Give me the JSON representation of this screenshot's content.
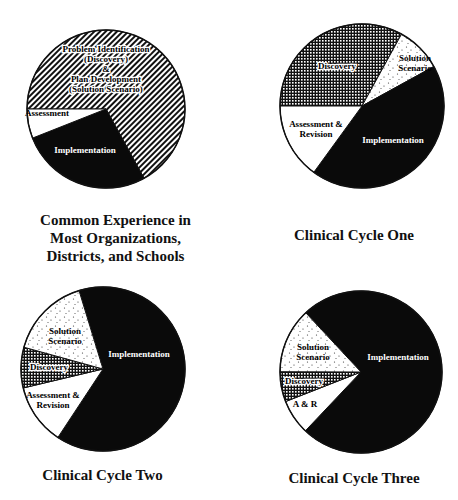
{
  "chart_data": [
    {
      "type": "pie",
      "title": "Common Experience in Most Organizations, Districts, and Schools",
      "title_lines": [
        "Common Experience in",
        "Most Organizations,",
        "Districts, and Schools"
      ],
      "center": [
        106,
        109
      ],
      "radius": 79,
      "start_angle": 270,
      "slices": [
        {
          "label": "Problem Identification (Discovery) & Plan Development (Solution Scenario)",
          "label_lines": [
            "Problem Identification",
            "(Discovery)",
            "&",
            "Plan Development",
            "(Solution Scenario)"
          ],
          "value": 67,
          "pattern": "diagonal",
          "label_pos": [
            106,
            52
          ],
          "label_color": "#000",
          "label_bg": true
        },
        {
          "label": "Implementation",
          "label_lines": [
            "Implementation"
          ],
          "value": 27,
          "pattern": "black",
          "label_pos": [
            85,
            153
          ],
          "label_color": "#fff"
        },
        {
          "label": "Assessment",
          "label_lines": [
            "Assessment"
          ],
          "value": 6,
          "pattern": "white",
          "label_pos": [
            47,
            116
          ],
          "label_color": "#000"
        }
      ],
      "order_note": "clockwise from 9 o'clock: Problem/Plan, Implementation, Assessment"
    },
    {
      "type": "pie",
      "title": "Clinical Cycle One",
      "title_lines": [
        "Clinical Cycle One"
      ],
      "center": [
        362,
        106
      ],
      "radius": 82,
      "start_angle": 270,
      "slices": [
        {
          "label": "Discovery",
          "label_lines": [
            "Discovery"
          ],
          "value": 33,
          "pattern": "grid",
          "label_pos": [
            337,
            69
          ],
          "label_color": "#000",
          "label_bg": true
        },
        {
          "label": "Solution Scenario",
          "label_lines": [
            "Solution",
            "Scenario"
          ],
          "value": 9,
          "pattern": "dots",
          "label_pos": [
            415,
            61
          ],
          "label_color": "#000"
        },
        {
          "label": "Implementation",
          "label_lines": [
            "Implementation"
          ],
          "value": 43,
          "pattern": "black",
          "label_pos": [
            393,
            143
          ],
          "label_color": "#fff"
        },
        {
          "label": "Assessment & Revision",
          "label_lines": [
            "Assessment &",
            "Revision"
          ],
          "value": 15,
          "pattern": "white",
          "label_pos": [
            316,
            127
          ],
          "label_color": "#000"
        }
      ]
    },
    {
      "type": "pie",
      "title": "Clinical Cycle Two",
      "title_lines": [
        "Clinical Cycle Two"
      ],
      "center": [
        103,
        369
      ],
      "radius": 82,
      "start_angle": 343,
      "slices": [
        {
          "label": "Implementation",
          "label_lines": [
            "Implementation"
          ],
          "value": 64,
          "pattern": "black",
          "label_pos": [
            139,
            357
          ],
          "label_color": "#fff"
        },
        {
          "label": "Assessment & Revision",
          "label_lines": [
            "Assessment &",
            "Revision"
          ],
          "value": 12,
          "pattern": "white",
          "label_pos": [
            53,
            398
          ],
          "label_color": "#000"
        },
        {
          "label": "Discovery",
          "label_lines": [
            "Discovery"
          ],
          "value": 8,
          "pattern": "grid",
          "label_pos": [
            49,
            370
          ],
          "label_color": "#000",
          "label_bg": true
        },
        {
          "label": "Solution Scenario",
          "label_lines": [
            "Solution",
            "Scenario"
          ],
          "value": 16,
          "pattern": "dots",
          "label_pos": [
            65,
            334
          ],
          "label_color": "#000"
        }
      ]
    },
    {
      "type": "pie",
      "title": "Clinical Cycle Three",
      "title_lines": [
        "Clinical Cycle Three"
      ],
      "center": [
        361,
        372
      ],
      "radius": 81,
      "start_angle": 317,
      "slices": [
        {
          "label": "Implementation",
          "label_lines": [
            "Implementation"
          ],
          "value": 74,
          "pattern": "black",
          "label_pos": [
            398,
            360
          ],
          "label_color": "#fff"
        },
        {
          "label": "A & R",
          "label_lines": [
            "A & R"
          ],
          "value": 7,
          "pattern": "white",
          "label_pos": [
            305,
            407
          ],
          "label_color": "#000"
        },
        {
          "label": "Discovery",
          "label_lines": [
            "Discovery"
          ],
          "value": 6,
          "pattern": "grid",
          "label_pos": [
            304,
            384
          ],
          "label_color": "#000",
          "label_bg": true
        },
        {
          "label": "Solution Scenario",
          "label_lines": [
            "Solution",
            "Scenario"
          ],
          "value": 13,
          "pattern": "dots",
          "label_pos": [
            313,
            350
          ],
          "label_color": "#000"
        }
      ]
    }
  ],
  "captions": [
    {
      "lines": [
        "Common Experience in",
        "Most Organizations,",
        "Districts, and Schools"
      ],
      "pos": [
        3,
        211,
        225
      ]
    },
    {
      "lines": [
        "Clinical Cycle One"
      ],
      "pos": [
        250,
        226,
        208
      ]
    },
    {
      "lines": [
        "Clinical Cycle Two"
      ],
      "pos": [
        0,
        466,
        205
      ]
    },
    {
      "lines": [
        "Clinical Cycle Three"
      ],
      "pos": [
        250,
        469,
        208
      ]
    }
  ]
}
